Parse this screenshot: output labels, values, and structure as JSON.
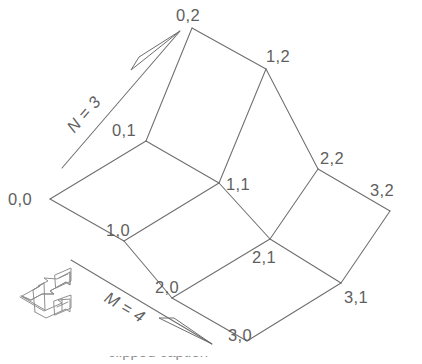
{
  "figure": {
    "background_color": "#ffffff",
    "line_color": "#6e6e6e",
    "label_color": "#5f5f5f"
  },
  "nodes": [
    {
      "label": "0,0",
      "i": 0,
      "j": 0,
      "x": 50,
      "y": 199,
      "label_x": 8,
      "label_y": 205
    },
    {
      "label": "1,0",
      "i": 1,
      "j": 0,
      "x": 124,
      "y": 241,
      "label_x": 107,
      "label_y": 234
    },
    {
      "label": "2,0",
      "i": 2,
      "j": 0,
      "x": 172,
      "y": 298,
      "label_x": 155,
      "label_y": 291
    },
    {
      "label": "3,0",
      "i": 3,
      "j": 0,
      "x": 247,
      "y": 341,
      "label_x": 229,
      "label_y": 334
    },
    {
      "label": "0,1",
      "i": 0,
      "j": 1,
      "x": 146,
      "y": 141,
      "label_x": 110,
      "label_y": 134
    },
    {
      "label": "1,1",
      "i": 1,
      "j": 1,
      "x": 219,
      "y": 183,
      "label_x": 226,
      "label_y": 190
    },
    {
      "label": "2,1",
      "i": 2,
      "j": 1,
      "x": 270,
      "y": 239,
      "label_x": 252,
      "label_y": 261
    },
    {
      "label": "3,1",
      "i": 3,
      "j": 1,
      "x": 341,
      "y": 283,
      "label_x": 346,
      "label_y": 301
    },
    {
      "label": "0,2",
      "i": 0,
      "j": 2,
      "x": 192,
      "y": 28,
      "label_x": 175,
      "label_y": 21
    },
    {
      "label": "1,2",
      "i": 1,
      "j": 2,
      "x": 266,
      "y": 69,
      "label_x": 267,
      "label_y": 62
    },
    {
      "label": "2,2",
      "i": 2,
      "j": 2,
      "x": 318,
      "y": 169,
      "label_x": 320,
      "label_y": 163
    },
    {
      "label": "3,2",
      "i": 3,
      "j": 2,
      "x": 390,
      "y": 211,
      "label_x": 370,
      "label_y": 195
    }
  ],
  "edges": [
    {
      "from": "0,0",
      "to": "1,0"
    },
    {
      "from": "1,0",
      "to": "2,0"
    },
    {
      "from": "2,0",
      "to": "3,0"
    },
    {
      "from": "0,1",
      "to": "1,1"
    },
    {
      "from": "1,1",
      "to": "2,1"
    },
    {
      "from": "2,1",
      "to": "3,1"
    },
    {
      "from": "0,2",
      "to": "1,2"
    },
    {
      "from": "1,2",
      "to": "2,2"
    },
    {
      "from": "2,2",
      "to": "3,2"
    },
    {
      "from": "0,0",
      "to": "0,1"
    },
    {
      "from": "0,1",
      "to": "0,2"
    },
    {
      "from": "1,0",
      "to": "1,1"
    },
    {
      "from": "1,1",
      "to": "1,2"
    },
    {
      "from": "2,0",
      "to": "2,1"
    },
    {
      "from": "2,1",
      "to": "2,2"
    },
    {
      "from": "3,0",
      "to": "3,1"
    },
    {
      "from": "3,1",
      "to": "3,2"
    }
  ],
  "axes": [
    {
      "name": "n-axis",
      "label": "N = 3",
      "value": 3,
      "label_x": 88,
      "label_y": 118,
      "label_rotation": -45,
      "tail_x": 62,
      "tail_y": 168,
      "tip_x": 180,
      "tip_y": 31,
      "direction": "up-right"
    },
    {
      "name": "m-axis",
      "label": "M = 4",
      "value": 4,
      "label_x": 108,
      "label_y": 310,
      "label_rotation": 30,
      "tail_x": 71,
      "tail_y": 260,
      "tip_x": 212,
      "tip_y": 344,
      "direction": "down-right"
    }
  ],
  "legend": {
    "name": "direction-key",
    "symbols": [
      "+",
      "+"
    ],
    "plus_top": "+",
    "plus_bottom": "+"
  },
  "caption": {
    "text": "clipped caption"
  }
}
